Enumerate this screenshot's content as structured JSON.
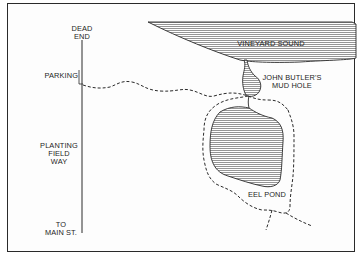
{
  "map": {
    "labels": {
      "dead_end": "DEAD\nEND",
      "parking": "PARKING",
      "planting_field_way": "PLANTING\nFIELD\nWAY",
      "to_main_st": "TO\nMAIN ST.",
      "vineyard_sound": "VINEYARD SOUND",
      "john_butlers_mud_hole": "JOHN BUTLER'S\nMUD HOLE",
      "eel_pond": "EEL POND"
    },
    "colors": {
      "ink": "#2a2a2a",
      "water_hatch": "#7a7a7a",
      "background": "#ffffff"
    },
    "legend": {
      "road": "solid line",
      "trail": "dashed line",
      "water": "hatched fill"
    }
  }
}
